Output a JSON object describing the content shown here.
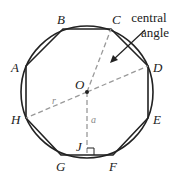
{
  "diagram": {
    "vertices": [
      {
        "id": "A",
        "label": "A",
        "x": 26,
        "y": 66,
        "lx": 11,
        "ly": 72
      },
      {
        "id": "B",
        "label": "B",
        "x": 63,
        "y": 29,
        "lx": 57,
        "ly": 24
      },
      {
        "id": "C",
        "label": "C",
        "x": 111,
        "y": 29,
        "lx": 112,
        "ly": 24
      },
      {
        "id": "D",
        "label": "D",
        "x": 148,
        "y": 66,
        "lx": 153,
        "ly": 72
      },
      {
        "id": "E",
        "label": "E",
        "x": 148,
        "y": 118,
        "lx": 153,
        "ly": 124
      },
      {
        "id": "F",
        "label": "F",
        "x": 113,
        "y": 155,
        "lx": 109,
        "ly": 171
      },
      {
        "id": "G",
        "label": "G",
        "x": 61,
        "y": 155,
        "lx": 56,
        "ly": 171
      },
      {
        "id": "H",
        "label": "H",
        "x": 26,
        "y": 118,
        "lx": 11,
        "ly": 124
      }
    ],
    "center": {
      "label": "O",
      "x": 87,
      "y": 92,
      "lx": 75,
      "ly": 89
    },
    "circle": {
      "cx": 87,
      "cy": 92,
      "r": 66
    },
    "foot": {
      "label": "J",
      "x": 87,
      "y": 155,
      "lx": 76,
      "ly": 151
    },
    "radius_label": "r",
    "apothem_label": "a",
    "annotation": {
      "line1": "central",
      "line2": "angle"
    },
    "colors": {
      "stroke": "#222222",
      "dashed": "#999999"
    }
  }
}
